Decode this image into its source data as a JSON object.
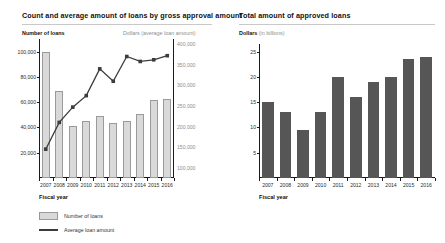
{
  "panels": {
    "left": {
      "title": "Count and average amount of loans by gross approval amount",
      "y_caption": "Number of loans",
      "y2_caption": "Dollars (average loan amount)",
      "x_title": "Fiscal year",
      "legend": [
        {
          "label": "Number of loans",
          "marker": "bar-swatch"
        },
        {
          "label": "Average loan amount",
          "marker": "line-swatch"
        }
      ]
    },
    "right": {
      "title": "Total amount of approved loans",
      "y_caption_bold": "Dollars",
      "y_caption_muted": " (in billions)",
      "x_title": "Fiscal year"
    }
  },
  "chart_data": [
    {
      "type": "bar",
      "id": "count-and-average-amount-of-loans",
      "title": "Count and average amount of loans by gross approval amount",
      "xlabel": "Fiscal year",
      "ylabel": "Number of loans",
      "y2label": "Dollars (average loan amount)",
      "categories": [
        "2007",
        "2008",
        "2009",
        "2010",
        "2011",
        "2012",
        "2013",
        "2014",
        "2015",
        "2016"
      ],
      "ylim": [
        0,
        110000
      ],
      "yticks": [
        20000,
        40000,
        60000,
        80000,
        100000
      ],
      "ytick_labels": [
        "20,000",
        "40,000",
        "60,000",
        "80,000",
        "100,000"
      ],
      "y2lim": [
        75000,
        412500
      ],
      "y2ticks": [
        100000,
        150000,
        200000,
        250000,
        300000,
        350000,
        400000
      ],
      "y2tick_labels": [
        "100,000",
        "150,000",
        "200,000",
        "250,000",
        "300,000",
        "350,000",
        "400,000"
      ],
      "grid": false,
      "legend_position": "bottom-left",
      "series": [
        {
          "name": "Number of loans",
          "type": "bar",
          "axis": "left",
          "color": "#d9d9d9",
          "values": [
            100000,
            69000,
            41000,
            45500,
            49000,
            43500,
            45000,
            51000,
            62000,
            62500
          ]
        },
        {
          "name": "Average loan amount",
          "type": "line",
          "axis": "right",
          "color": "#3c3c3c",
          "values": [
            145000,
            210000,
            247000,
            275000,
            340000,
            310000,
            370000,
            358000,
            362000,
            372000
          ]
        }
      ]
    },
    {
      "type": "bar",
      "id": "total-amount-of-approved-loans",
      "title": "Total amount of approved loans",
      "xlabel": "Fiscal year",
      "ylabel": "Dollars (in billions)",
      "categories": [
        "2007",
        "2008",
        "2009",
        "2010",
        "2011",
        "2012",
        "2013",
        "2014",
        "2015",
        "2016"
      ],
      "ylim": [
        0,
        26.5
      ],
      "yticks": [
        5,
        10,
        15,
        20,
        25
      ],
      "ytick_labels": [
        "5",
        "10",
        "15",
        "20",
        "25"
      ],
      "grid": false,
      "series": [
        {
          "name": "Total amount of approved loans",
          "type": "bar",
          "color": "#565656",
          "values": [
            15,
            13,
            9.5,
            13,
            20,
            16,
            19,
            20,
            23.5,
            24
          ]
        }
      ]
    }
  ]
}
